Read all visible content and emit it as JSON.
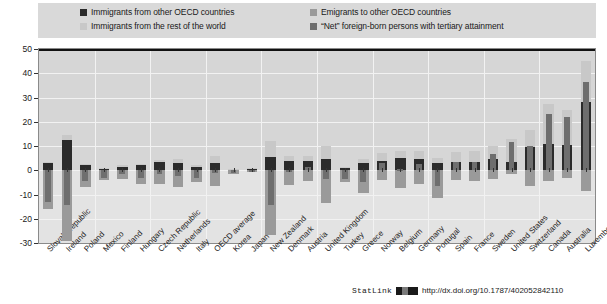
{
  "legend": {
    "items": [
      {
        "label": "Immigrants from other OECD countries",
        "color": "#2b2b2b",
        "key": "immigrants_oecd"
      },
      {
        "label": "Immigrants from the rest of the world",
        "color": "#c8c8c8",
        "key": "immigrants_row"
      },
      {
        "label": "Emigrants to other OECD countries",
        "color": "#9a9a9a",
        "key": "emigrants_oecd"
      },
      {
        "label": "“Net” foreign-born persons with tertiary attainment",
        "color": "#6e6e6e",
        "key": "net_foreign_born"
      }
    ]
  },
  "footer": {
    "statlink_label": "StatLink",
    "url": "http://dx.doi.org/10.1787/402052842110"
  },
  "chart_data": {
    "type": "bar",
    "title": "",
    "subtitle": "",
    "xlabel": "",
    "ylabel": "",
    "ylim": [
      -30,
      50
    ],
    "yticks": [
      -30,
      -20,
      -10,
      0,
      10,
      20,
      30,
      40,
      50
    ],
    "grid": true,
    "legend_position": "top",
    "stacked": true,
    "categories": [
      "Slovak Republic",
      "Ireland",
      "Poland",
      "Mexico",
      "Finland",
      "Hungary",
      "Czech Republic",
      "Netherlands",
      "Italy",
      "OECD average",
      "Korea",
      "Japan",
      "New Zealand",
      "Denmark",
      "Austria",
      "United Kingdom",
      "Turkey",
      "Greece",
      "Norway",
      "Belgium",
      "Germany",
      "Portugal",
      "Spain",
      "France",
      "Sweden",
      "United States",
      "Switzerland",
      "Canada",
      "Australia",
      "Luxembourg"
    ],
    "series": [
      {
        "name": "Immigrants from other OECD countries",
        "color": "#2b2b2b",
        "values": [
          3.0,
          12.5,
          2.0,
          0.6,
          1.5,
          2.0,
          3.5,
          3.0,
          1.2,
          2.8,
          0.3,
          0.5,
          5.5,
          4.0,
          4.0,
          4.5,
          1.0,
          3.0,
          4.0,
          5.0,
          4.5,
          3.0,
          3.5,
          3.5,
          4.5,
          3.5,
          9.5,
          11.0,
          10.5,
          28.0
        ]
      },
      {
        "name": "Immigrants from the rest of the world",
        "color": "#c8c8c8",
        "values": [
          0.5,
          2.0,
          0.5,
          0.3,
          0.8,
          0.5,
          0.8,
          1.5,
          0.8,
          3.0,
          0.2,
          0.3,
          6.5,
          2.0,
          2.0,
          5.5,
          0.5,
          1.5,
          3.0,
          3.0,
          3.5,
          2.0,
          4.0,
          4.5,
          5.5,
          9.5,
          7.0,
          16.5,
          14.5,
          17.0
        ]
      },
      {
        "name": "Emigrants to other OECD countries",
        "color": "#9a9a9a",
        "values": [
          -16.0,
          -29.0,
          -7.0,
          -4.0,
          -3.5,
          -5.5,
          -5.5,
          -7.0,
          -5.0,
          -6.5,
          -1.5,
          -0.8,
          -26.5,
          -6.0,
          -4.5,
          -13.5,
          -5.0,
          -9.5,
          -4.0,
          -7.5,
          -5.5,
          -11.5,
          -4.0,
          -4.5,
          -3.5,
          -1.5,
          -6.5,
          -4.5,
          -3.0,
          -8.5
        ]
      },
      {
        "name": "“Net” foreign-born persons with tertiary attainment",
        "color": "#6e6e6e",
        "values": [
          -13.0,
          -14.5,
          -4.5,
          -3.0,
          -1.5,
          -3.0,
          -1.5,
          -2.5,
          -3.0,
          -1.0,
          -1.0,
          0.0,
          -14.5,
          0.0,
          1.5,
          -3.5,
          -3.5,
          -5.0,
          3.0,
          0.5,
          2.5,
          -6.5,
          3.5,
          3.5,
          6.5,
          11.5,
          10.0,
          23.0,
          22.0,
          36.5
        ]
      }
    ]
  }
}
